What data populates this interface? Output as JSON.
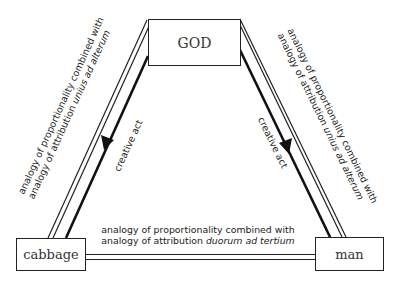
{
  "nodes": {
    "god": {
      "label": "GOD"
    },
    "cabbage": {
      "label": "cabbage"
    },
    "man": {
      "label": "man"
    }
  },
  "edges": {
    "left": {
      "line1": "analogy of proportionality combined with",
      "line2_prefix": "analogy of attribution ",
      "line2_italic": "unius ad alterum"
    },
    "right": {
      "line1": "analogy of proportionality combined with",
      "line2_prefix": "analogy of attribution ",
      "line2_italic": "unius ad alterum"
    },
    "bottom": {
      "line1": "analogy of proportionality combined with",
      "line2_prefix": "analogy of attribution ",
      "line2_italic": "duorum ad tertium"
    },
    "creative_left": {
      "label": "creative act"
    },
    "creative_right": {
      "label": "creative act"
    }
  }
}
